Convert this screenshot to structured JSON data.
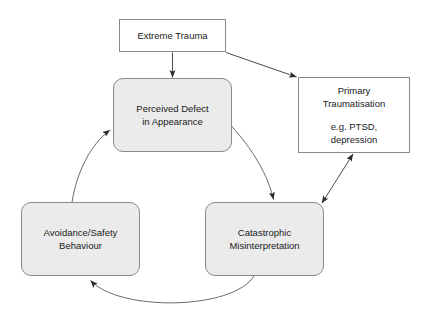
{
  "diagram": {
    "background_color": "#ffffff",
    "node_fill_plain": "#ffffff",
    "node_fill_shaded": "#ebebeb",
    "node_border_color": "#8a8a8a",
    "text_color": "#1a1a1a",
    "nodes": [
      {
        "id": "extreme-trauma",
        "shape": "rectangle",
        "lines": [
          "Extreme Trauma"
        ]
      },
      {
        "id": "perceived-defect",
        "shape": "rounded-rectangle",
        "lines": [
          "Perceived Defect",
          "in Appearance"
        ]
      },
      {
        "id": "primary-traumatisation",
        "shape": "rectangle",
        "lines": [
          "Primary",
          "Traumatisation",
          "",
          "e.g. PTSD,",
          "depression"
        ]
      },
      {
        "id": "avoidance-safety-behaviour",
        "shape": "rounded-rectangle",
        "lines": [
          "Avoidance/Safety",
          "Behaviour"
        ]
      },
      {
        "id": "catastrophic-misinterpretation",
        "shape": "rounded-rectangle",
        "lines": [
          "Catastrophic",
          "Misinterpretation"
        ]
      }
    ],
    "connectors": [
      {
        "id": "trauma-to-defect",
        "from": "extreme-trauma",
        "to": "perceived-defect",
        "style": "straight",
        "arrowheads": "end"
      },
      {
        "id": "trauma-to-primary",
        "from": "extreme-trauma",
        "to": "primary-traumatisation",
        "style": "straight",
        "arrowheads": "end"
      },
      {
        "id": "defect-to-catastrophic",
        "from": "perceived-defect",
        "to": "catastrophic-misinterpretation",
        "style": "curved",
        "arrowheads": "end"
      },
      {
        "id": "catastrophic-to-avoidance",
        "from": "catastrophic-misinterpretation",
        "to": "avoidance-safety-behaviour",
        "style": "curved",
        "arrowheads": "end"
      },
      {
        "id": "avoidance-to-defect",
        "from": "avoidance-safety-behaviour",
        "to": "perceived-defect",
        "style": "curved",
        "arrowheads": "end"
      },
      {
        "id": "catastrophic-primary-bidirectional",
        "from": "catastrophic-misinterpretation",
        "to": "primary-traumatisation",
        "style": "straight",
        "arrowheads": "both"
      }
    ]
  }
}
